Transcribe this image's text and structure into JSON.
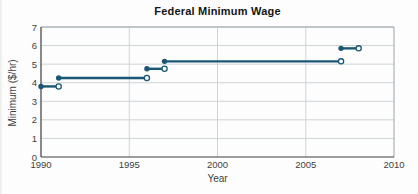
{
  "figure": {
    "title": "Federal Minimum Wage",
    "xlabel": "Year",
    "ylabel": "Minimum ($/hr)"
  },
  "chart_data": {
    "type": "line",
    "subtype": "step-function",
    "title": "Federal Minimum Wage",
    "xlabel": "Year",
    "ylabel": "Minimum ($/hr)",
    "xlim": [
      1990,
      2010
    ],
    "ylim": [
      0,
      7
    ],
    "xticks": [
      1990,
      1995,
      2000,
      2005,
      2010
    ],
    "yticks": [
      0,
      1,
      2,
      3,
      4,
      5,
      6,
      7
    ],
    "grid": true,
    "legend": "none",
    "segments": [
      {
        "start_year": 1990,
        "end_year": 1991,
        "wage": 3.8,
        "start_marker": "closed",
        "end_marker": "open"
      },
      {
        "start_year": 1991,
        "end_year": 1996,
        "wage": 4.25,
        "start_marker": "closed",
        "end_marker": "open"
      },
      {
        "start_year": 1996,
        "end_year": 1997,
        "wage": 4.75,
        "start_marker": "closed",
        "end_marker": "open"
      },
      {
        "start_year": 1997,
        "end_year": 2007,
        "wage": 5.15,
        "start_marker": "closed",
        "end_marker": "open"
      },
      {
        "start_year": 2007,
        "end_year": 2008,
        "wage": 5.85,
        "start_marker": "closed",
        "end_marker": "open"
      }
    ],
    "colors": {
      "line": "#1b5775",
      "marker_open_fill": "#ffffff",
      "grid": "#ccd4d8",
      "axis": "#3c3c3c",
      "border": "#9aa4a8",
      "text": "#3d3d3d",
      "title": "#151515"
    }
  }
}
